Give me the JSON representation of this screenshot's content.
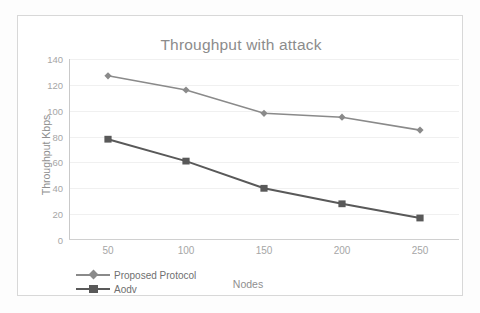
{
  "chart_data": {
    "type": "line",
    "title": "Throughput with attack",
    "xlabel": "Nodes",
    "ylabel": "Throughput Kbps",
    "categories": [
      "50",
      "100",
      "150",
      "200",
      "250"
    ],
    "x": [
      50,
      100,
      150,
      200,
      250
    ],
    "xlim": [
      25,
      275
    ],
    "ylim": [
      0,
      140
    ],
    "yticks": [
      "0",
      "20",
      "40",
      "60",
      "80",
      "100",
      "120",
      "140"
    ],
    "ytick_values": [
      0,
      20,
      40,
      60,
      80,
      100,
      120,
      140
    ],
    "grid": true,
    "legend_position": "bottom-left",
    "series": [
      {
        "name": "Proposed Protocol",
        "marker": "diamond",
        "color": "#8a8a8a",
        "values": [
          127,
          116,
          98,
          95,
          85
        ]
      },
      {
        "name": "Aodv",
        "marker": "square",
        "color": "#595959",
        "values": [
          78,
          61,
          40,
          28,
          17
        ]
      }
    ]
  },
  "colors": {
    "title_text": "#8c8c8c",
    "tick_text": "#a6a6a6",
    "axis_label_text": "#8f8f8f",
    "legend_text": "#6f6f6f",
    "gridline": "#f0f0f0",
    "axis_line": "#c9c9c9",
    "frame_border": "#d8d8d8",
    "background": "#ffffff",
    "series_proposed": "#8a8a8a",
    "series_aodv": "#595959"
  }
}
